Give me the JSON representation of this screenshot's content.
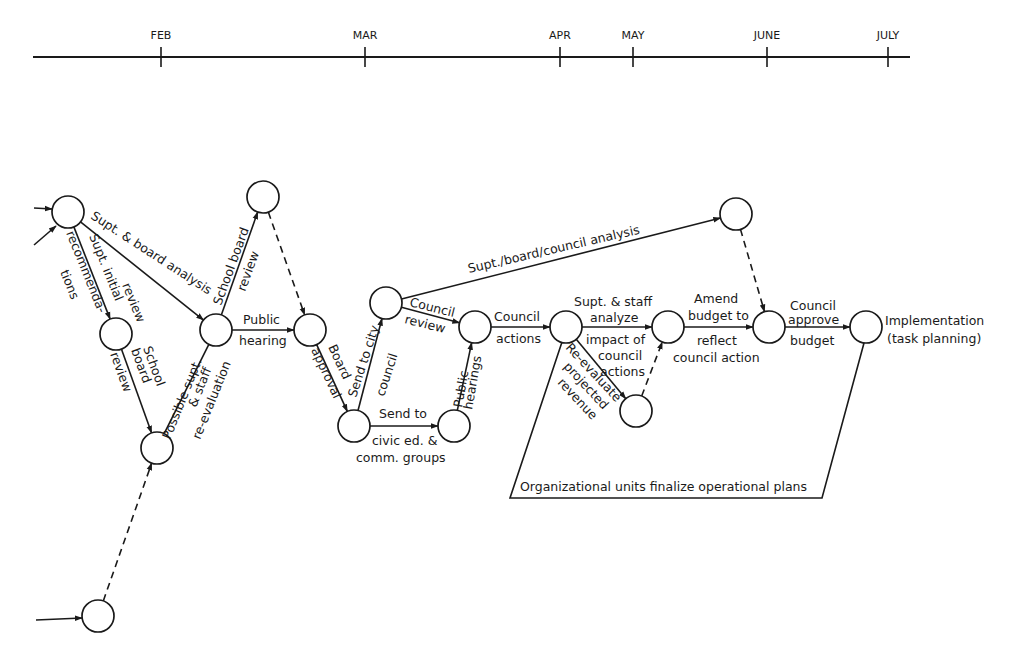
{
  "timeline": {
    "line": {
      "x1": 33,
      "x2": 910,
      "y": 57
    },
    "months": [
      {
        "label": "FEB",
        "x": 161
      },
      {
        "label": "MAR",
        "x": 365
      },
      {
        "label": "APR",
        "x": 560
      },
      {
        "label": "MAY",
        "x": 633
      },
      {
        "label": "JUNE",
        "x": 767
      },
      {
        "label": "JULY",
        "x": 888
      }
    ]
  },
  "nodes": [
    {
      "id": "n1",
      "x": 68,
      "y": 212
    },
    {
      "id": "n2",
      "x": 116,
      "y": 334
    },
    {
      "id": "n3",
      "x": 157,
      "y": 448
    },
    {
      "id": "n4",
      "x": 98,
      "y": 616
    },
    {
      "id": "n5",
      "x": 216,
      "y": 330
    },
    {
      "id": "n6",
      "x": 263,
      "y": 197
    },
    {
      "id": "n7",
      "x": 310,
      "y": 330
    },
    {
      "id": "n8",
      "x": 354,
      "y": 426
    },
    {
      "id": "n9",
      "x": 386,
      "y": 303
    },
    {
      "id": "n10",
      "x": 454,
      "y": 426
    },
    {
      "id": "n11",
      "x": 475,
      "y": 327
    },
    {
      "id": "n12",
      "x": 566,
      "y": 327
    },
    {
      "id": "n13",
      "x": 736,
      "y": 214
    },
    {
      "id": "n14",
      "x": 668,
      "y": 327
    },
    {
      "id": "n15",
      "x": 636,
      "y": 411
    },
    {
      "id": "n16",
      "x": 769,
      "y": 327
    },
    {
      "id": "n17",
      "x": 866,
      "y": 327
    }
  ],
  "node_radius": 16,
  "edges": [
    {
      "from": "n1",
      "to": "n2",
      "dashed": false
    },
    {
      "from": "n1",
      "to": "n5",
      "dashed": false
    },
    {
      "from": "n2",
      "to": "n3",
      "dashed": false
    },
    {
      "from": "n4",
      "to": "n3",
      "dashed": true
    },
    {
      "from": "n3",
      "to": "n5",
      "dashed": false,
      "arrow": false
    },
    {
      "from": "n5",
      "to": "n6",
      "dashed": false
    },
    {
      "from": "n5",
      "to": "n7",
      "dashed": false
    },
    {
      "from": "n6",
      "to": "n7",
      "dashed": true
    },
    {
      "from": "n7",
      "to": "n8",
      "dashed": false
    },
    {
      "from": "n8",
      "to": "n9",
      "dashed": false
    },
    {
      "from": "n8",
      "to": "n10",
      "dashed": false
    },
    {
      "from": "n9",
      "to": "n11",
      "dashed": false
    },
    {
      "from": "n9",
      "to": "n13",
      "dashed": false
    },
    {
      "from": "n10",
      "to": "n11",
      "dashed": false
    },
    {
      "from": "n11",
      "to": "n12",
      "dashed": false
    },
    {
      "from": "n12",
      "to": "n14",
      "dashed": false
    },
    {
      "from": "n12",
      "to": "n15",
      "dashed": false
    },
    {
      "from": "n15",
      "to": "n14",
      "dashed": true
    },
    {
      "from": "n14",
      "to": "n16",
      "dashed": false
    },
    {
      "from": "n13",
      "to": "n16",
      "dashed": true
    },
    {
      "from": "n16",
      "to": "n17",
      "dashed": false
    }
  ],
  "incoming_arrows": [
    {
      "x1": 34,
      "y1": 208,
      "x2": 52,
      "y2": 209
    },
    {
      "x1": 34,
      "y1": 245,
      "x2": 56,
      "y2": 226
    },
    {
      "x1": 36,
      "y1": 620,
      "x2": 82,
      "y2": 618
    }
  ],
  "labels": {
    "supt_board_analysis": "Supt. & board analysis",
    "supt_initial": "Supt. initial",
    "recommendations_1": "recommenda-",
    "recommendations_2": "tions",
    "review_1": "review",
    "school_board_1": "School",
    "school_board_2": "board",
    "school_board_3": "review",
    "possible_supt_1": "Possible supt.",
    "possible_supt_2": "& staff",
    "possible_supt_3": "re-evaluation",
    "school_board_review_1": "School board",
    "school_board_review_2": "review",
    "public_hearing_1": "Public",
    "public_hearing_2": "hearing",
    "board_approval_1": "Board",
    "board_approval_2": "approval",
    "send_city_1": "Send to city",
    "send_city_2": "council",
    "send_civic_1": "Send to",
    "send_civic_2": "civic ed. &",
    "send_civic_3": "comm. groups",
    "public_hearings_1": "Public",
    "public_hearings_2": "hearings",
    "council_review_1": "Council",
    "council_review_2": "review",
    "supt_board_council": "Supt./board/council analysis",
    "council_actions_1": "Council",
    "council_actions_2": "actions",
    "supt_staff_1": "Supt. & staff",
    "supt_staff_2": "analyze",
    "supt_staff_3": "impact of",
    "supt_staff_4": "council",
    "supt_staff_5": "actions",
    "reevaluate_1": "Re-evaluate",
    "reevaluate_2": "projected",
    "reevaluate_3": "revenue",
    "amend_1": "Amend",
    "amend_2": "budget to",
    "amend_3": "reflect",
    "amend_4": "council action",
    "council_approve_1": "Council",
    "council_approve_2": "approve",
    "council_approve_3": "budget",
    "implementation_1": "Implementation",
    "implementation_2": "(task planning)",
    "org_units": "Organizational units finalize operational plans"
  },
  "org_box": {
    "left_top": [
      548,
      343
    ],
    "left_bottom": [
      510,
      498
    ],
    "right_bottom": [
      822,
      498
    ],
    "right_top": [
      861,
      343
    ]
  },
  "colors": {
    "ink": "#1a1a1a",
    "background": "#ffffff"
  }
}
